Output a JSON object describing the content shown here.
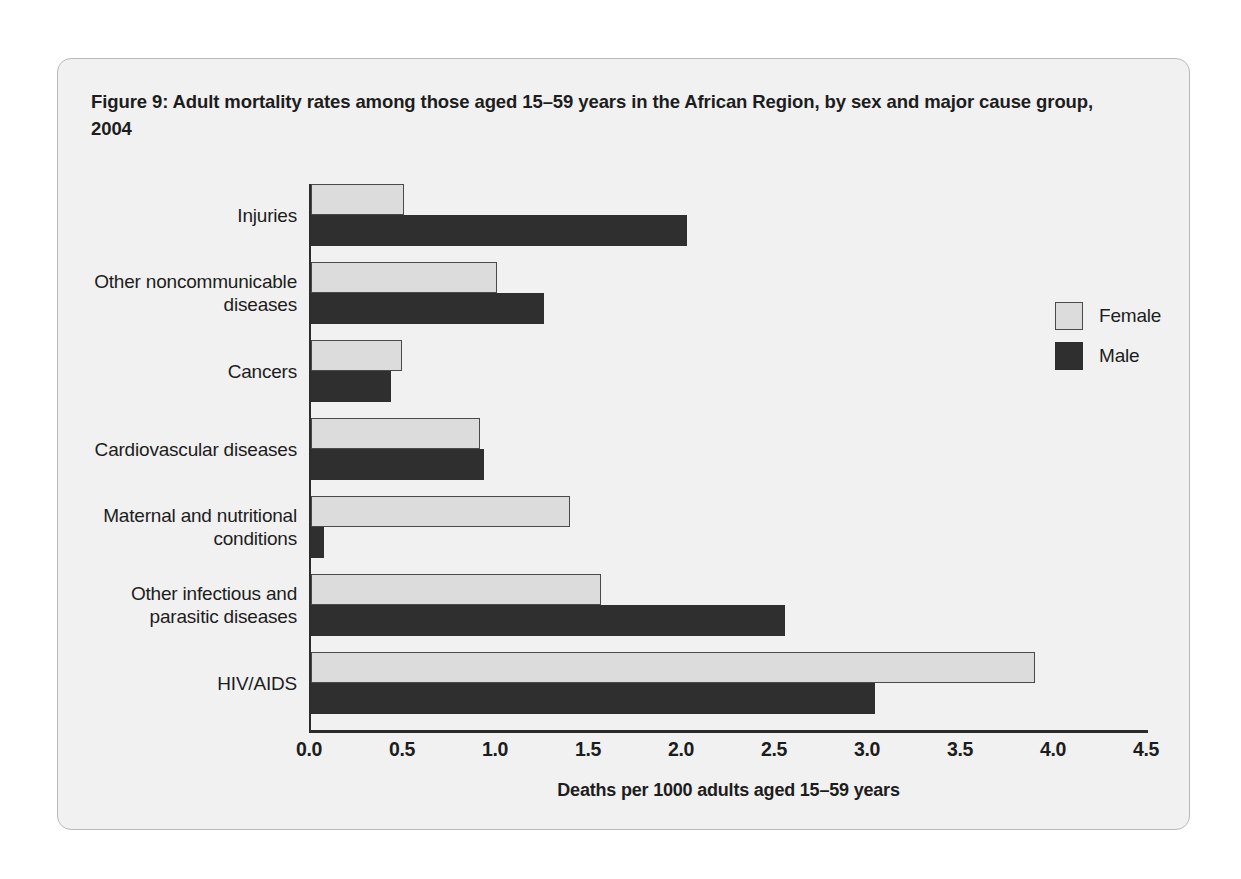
{
  "figure": {
    "title": "Figure 9: Adult mortality rates among those aged 15–59 years in the African Region, by sex and major cause group, 2004"
  },
  "chart_data": {
    "type": "bar",
    "orientation": "horizontal",
    "title": "Figure 9: Adult mortality rates among those aged 15–59 years in the African Region, by sex and major cause group, 2004",
    "xlabel": "Deaths per 1000 adults aged 15–59 years",
    "ylabel": "",
    "xlim": [
      0.0,
      4.5
    ],
    "xticks": [
      "0.0",
      "0.5",
      "1.0",
      "1.5",
      "2.0",
      "2.5",
      "3.0",
      "3.5",
      "4.0",
      "4.5"
    ],
    "xtick_values": [
      0.0,
      0.5,
      1.0,
      1.5,
      2.0,
      2.5,
      3.0,
      3.5,
      4.0,
      4.5
    ],
    "grid": false,
    "legend_position": "right",
    "categories": [
      "Injuries",
      "Other noncommunicable diseases",
      "Cancers",
      "Cardiovascular diseases",
      "Maternal and nutritional conditions",
      "Other infectious and parasitic diseases",
      "HIV/AIDS"
    ],
    "series": [
      {
        "name": "Female",
        "color": "#dcdcdc",
        "values": [
          0.5,
          1.0,
          0.49,
          0.91,
          1.39,
          1.56,
          3.89
        ]
      },
      {
        "name": "Male",
        "color": "#2f2f2f",
        "values": [
          2.02,
          1.25,
          0.43,
          0.93,
          0.07,
          2.55,
          3.03
        ]
      }
    ]
  },
  "categories_display": [
    {
      "line1": "Injuries",
      "line2": ""
    },
    {
      "line1": "Other noncommunicable",
      "line2": "diseases"
    },
    {
      "line1": "Cancers",
      "line2": ""
    },
    {
      "line1": "Cardiovascular diseases",
      "line2": ""
    },
    {
      "line1": "Maternal and nutritional",
      "line2": "conditions"
    },
    {
      "line1": "Other infectious and",
      "line2": "parasitic diseases"
    },
    {
      "line1": "HIV/AIDS",
      "line2": ""
    }
  ],
  "axis": {
    "x_label": "Deaths per 1000 adults aged 15–59 years",
    "ticks": [
      "0.0",
      "0.5",
      "1.0",
      "1.5",
      "2.0",
      "2.5",
      "3.0",
      "3.5",
      "4.0",
      "4.5"
    ]
  },
  "legend": {
    "items": [
      {
        "label": "Female",
        "color": "#dcdcdc"
      },
      {
        "label": "Male",
        "color": "#2f2f2f"
      }
    ]
  },
  "colors": {
    "female": "#dcdcdc",
    "male": "#2f2f2f",
    "panel_background": "#f1f1f1",
    "panel_border": "#b9b9b9",
    "axis": "#2b2b2b",
    "text": "#1d1d1d"
  }
}
